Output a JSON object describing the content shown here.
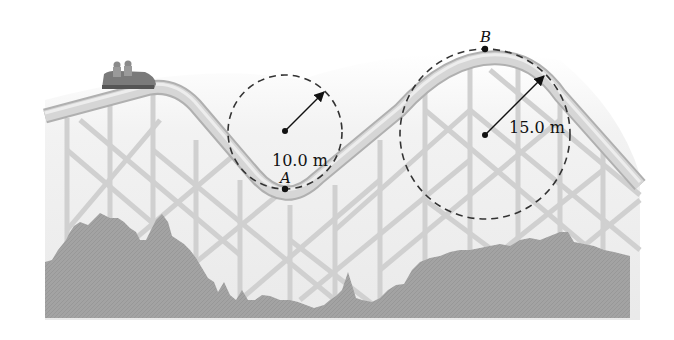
{
  "figure": {
    "colors": {
      "background": "#ffffff",
      "track": "#cfcfcf",
      "track_edge": "#b5b5b5",
      "support": "#d2d2d2",
      "foliage": "#a0a0a0",
      "ink": "#111111",
      "sky_haze": "#ececec"
    }
  },
  "points": {
    "a": {
      "label": "A",
      "radius_label": "10.0 m",
      "position": "bottom of valley"
    },
    "b": {
      "label": "B",
      "radius_label": "15.0 m",
      "position": "top of hill"
    }
  },
  "car": {
    "description": "roller coaster car with riders"
  }
}
